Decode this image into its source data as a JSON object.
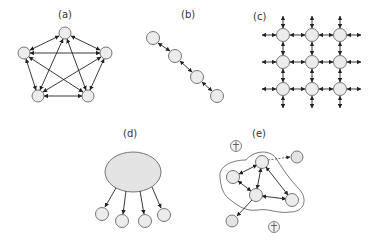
{
  "panels": [
    {
      "id": "a",
      "label": "(a)",
      "type": "fully-connected-pentagon",
      "nodes": 5
    },
    {
      "id": "b",
      "label": "(b)",
      "type": "chain",
      "nodes": 4
    },
    {
      "id": "c",
      "label": "(c)",
      "type": "grid-lattice",
      "rows": 3,
      "cols": 3
    },
    {
      "id": "d",
      "label": "(d)",
      "type": "hub-broadcast",
      "children": 4
    },
    {
      "id": "e",
      "label": "(e)",
      "type": "cluster-with-outsiders",
      "inner_nodes": 4,
      "outer_nodes": 2,
      "excluded_symbols": 2
    }
  ],
  "colors": {
    "node_fill": "#ececec",
    "node_stroke": "#666666",
    "edge": "#222222",
    "hub_fill": "#e4e4e4"
  }
}
